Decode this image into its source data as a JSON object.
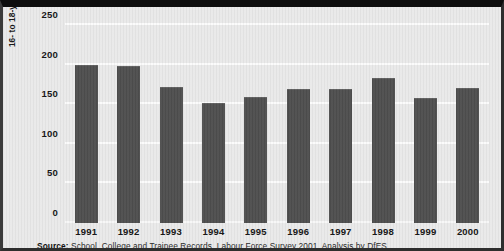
{
  "chart_data": {
    "type": "bar",
    "title": "",
    "xlabel": "",
    "ylabel": "16- to 18-year-olds not in education, training or work (thousands)",
    "categories": [
      "1991",
      "1992",
      "1993",
      "1994",
      "1995",
      "1996",
      "1997",
      "1998",
      "1999",
      "2000"
    ],
    "values": [
      199,
      198,
      172,
      152,
      159,
      169,
      169,
      183,
      158,
      170
    ],
    "ylim": [
      0,
      250
    ],
    "yticks": [
      0,
      50,
      100,
      150,
      200,
      250
    ],
    "ytick_labels": [
      "0",
      "50",
      "100",
      "150",
      "200",
      "250"
    ],
    "grid": true,
    "legend": "none",
    "bar_color": "#4e4e4e",
    "plot_background": "#e9e9e9",
    "gridline_color": "#fbfbfb"
  },
  "axis": {
    "y_title": "16- to 18-year-olds not in education, training or work (thousands)"
  },
  "source": {
    "label": "Source:",
    "text": " School, College and Trainee Records, Labour Force Survey 2001. Analysis by DfES"
  }
}
